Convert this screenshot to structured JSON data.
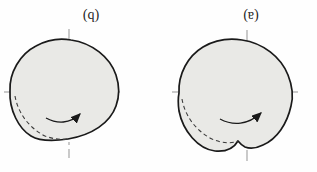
{
  "figure": {
    "type": "textbook-cam-diagram",
    "panels": [
      {
        "id": "left",
        "label": "(b)",
        "rotation_arrow": "curved-arrow-right"
      },
      {
        "id": "right",
        "label": "(a)",
        "rotation_arrow": "curved-arrow-right"
      }
    ]
  },
  "colors": {
    "background": "#fefefe",
    "cam_fill": "#e9e9e6",
    "cam_outline": "#1a1a1a",
    "centerline": "#959595",
    "dashed_arc": "#3a3a3a",
    "arrow": "#1a1a1a"
  }
}
